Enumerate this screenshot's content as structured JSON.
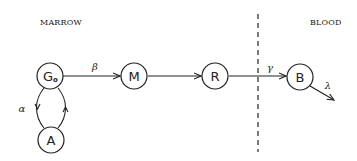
{
  "diagram": {
    "type": "compartment-flow",
    "regions": [
      {
        "id": "marrow",
        "label": "MARROW"
      },
      {
        "id": "blood",
        "label": "BLOOD"
      }
    ],
    "nodes": [
      {
        "id": "G0",
        "label": "G",
        "subscript": "o",
        "region": "marrow"
      },
      {
        "id": "M",
        "label": "M",
        "region": "marrow"
      },
      {
        "id": "R",
        "label": "R",
        "region": "marrow"
      },
      {
        "id": "A",
        "label": "A",
        "region": "marrow"
      },
      {
        "id": "B",
        "label": "B",
        "region": "blood"
      }
    ],
    "edges": [
      {
        "from": "G0",
        "to": "M",
        "rate": "β"
      },
      {
        "from": "M",
        "to": "R",
        "rate": ""
      },
      {
        "from": "R",
        "to": "B",
        "rate": "γ"
      },
      {
        "from": "B",
        "to": "out",
        "rate": "λ"
      },
      {
        "from": "G0",
        "to": "A",
        "rate": "α"
      },
      {
        "from": "A",
        "to": "G0",
        "rate": ""
      }
    ],
    "colors": {
      "ink": "#222222",
      "background": "#ffffff"
    }
  }
}
